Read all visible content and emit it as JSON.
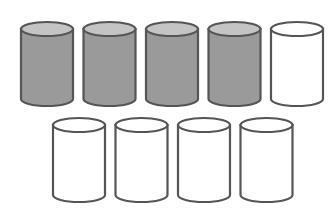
{
  "diagram": {
    "colors": {
      "filled": "#9a9a9a",
      "filled_top": "#c4c4c4",
      "empty": "#ffffff",
      "stroke": "#555555"
    },
    "rows": [
      {
        "cylinders": [
          {
            "filled": true
          },
          {
            "filled": true
          },
          {
            "filled": true
          },
          {
            "filled": true
          },
          {
            "filled": false
          }
        ]
      },
      {
        "cylinders": [
          {
            "filled": false
          },
          {
            "filled": false
          },
          {
            "filled": false
          },
          {
            "filled": false
          }
        ]
      }
    ],
    "filled_count": 4,
    "total_count": 9
  }
}
